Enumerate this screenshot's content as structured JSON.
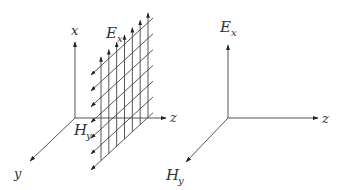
{
  "left_figure": {
    "axis_x_label": "x",
    "axis_y_label": "y",
    "axis_z_label": "z",
    "field_e_label": "E",
    "field_e_sub": "x",
    "field_h_label": "H",
    "field_h_sub": "y",
    "grid_vertical_arrows": 7,
    "grid_diagonal_arrows": 7
  },
  "right_figure": {
    "vertical_label": "E",
    "vertical_sub": "x",
    "diagonal_label": "H",
    "diagonal_sub": "y",
    "horizontal_label": "z"
  }
}
